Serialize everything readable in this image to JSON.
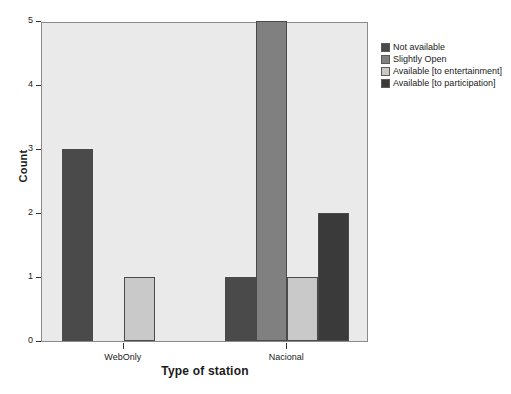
{
  "chart_data": {
    "type": "bar",
    "title": "",
    "xlabel": "Type of station",
    "ylabel": "Count",
    "categories": [
      "WebOnly",
      "Nacional"
    ],
    "ylim": [
      0,
      5
    ],
    "yticks": [
      "0",
      "1",
      "2",
      "3",
      "4",
      "5"
    ],
    "grid": false,
    "legend_position": "right",
    "series": [
      {
        "name": "Not available",
        "color": "#4a4a4a",
        "values": [
          3,
          1
        ]
      },
      {
        "name": "Slightly Open",
        "color": "#808080",
        "values": [
          0,
          5
        ]
      },
      {
        "name": "Available [to entertainment]",
        "color": "#c9c9c9",
        "values": [
          1,
          1
        ]
      },
      {
        "name": "Available [to participation]",
        "color": "#3a3a3a",
        "values": [
          0,
          2
        ]
      }
    ]
  },
  "style": {
    "plot_background": "#eaeaea",
    "page_background": "#ffffff",
    "frame_color": "#8a8a8a",
    "text_color": "#1a1a1a"
  }
}
